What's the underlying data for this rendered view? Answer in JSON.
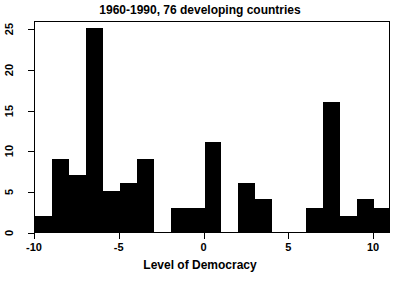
{
  "chart_data": {
    "type": "bar",
    "title": "1960-1990, 76 developing countries",
    "subtitle": "",
    "xlabel": "Level of Democracy",
    "ylabel": "",
    "xlim": [
      -10,
      11
    ],
    "ylim": [
      0,
      26
    ],
    "grid": false,
    "legend": null,
    "bin_width": 1,
    "categories": [
      "-10",
      "-9",
      "-8",
      "-7",
      "-6",
      "-5",
      "-4",
      "-3",
      "-2",
      "-1",
      "0",
      "1",
      "2",
      "3",
      "4",
      "5",
      "6",
      "7",
      "8",
      "9",
      "10"
    ],
    "bin_starts": [
      -10,
      -9,
      -8,
      -7,
      -6,
      -5,
      -4,
      -3,
      -2,
      -1,
      0,
      1,
      2,
      3,
      4,
      5,
      6,
      7,
      8,
      9,
      10
    ],
    "values": [
      2,
      9,
      7,
      25,
      5,
      6,
      9,
      0,
      3,
      3,
      11,
      0,
      6,
      4,
      0,
      0,
      3,
      16,
      2,
      4,
      3
    ],
    "xticks": [
      -10,
      -5,
      0,
      5,
      10
    ],
    "xticklabels": [
      "-10",
      "-5",
      "0",
      "5",
      "10"
    ],
    "yticks": [
      0,
      5,
      10,
      15,
      20,
      25
    ],
    "yticklabels": [
      "0",
      "5",
      "10",
      "15",
      "20",
      "25"
    ],
    "bar_color": "#000000",
    "background_color": "#ffffff",
    "axis_color": "#000000"
  }
}
